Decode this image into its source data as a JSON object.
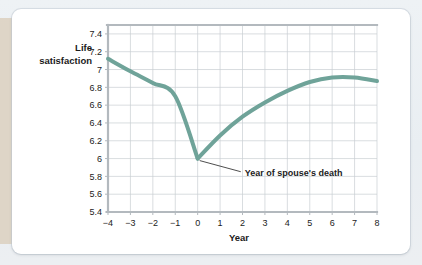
{
  "card": {
    "background_color": "#ffffff",
    "backdrop_color": "#eef1f4",
    "strip_color": "#ddd3c4"
  },
  "chart_data": {
    "type": "line",
    "title": "",
    "xlabel": "Year",
    "ylabel": "Life satisfaction",
    "ylabel_line1": "Life",
    "ylabel_line2": "satisfaction",
    "xlim": [
      -4,
      8
    ],
    "ylim": [
      5.4,
      7.5
    ],
    "grid": true,
    "legend": "none",
    "line_color": "#6fa399",
    "line_width": 4,
    "x": [
      -4,
      -3,
      -2,
      -1,
      0,
      1,
      2,
      3,
      4,
      5,
      6,
      7,
      8
    ],
    "values": [
      7.12,
      6.98,
      6.85,
      6.7,
      6.0,
      6.26,
      6.47,
      6.63,
      6.76,
      6.86,
      6.91,
      6.91,
      6.87
    ],
    "xticks": [
      "−4",
      "−3",
      "−2",
      "−1",
      "0",
      "1",
      "2",
      "3",
      "4",
      "5",
      "6",
      "7",
      "8"
    ],
    "xtick_values": [
      -4,
      -3,
      -2,
      -1,
      0,
      1,
      2,
      3,
      4,
      5,
      6,
      7,
      8
    ],
    "yticks": [
      "7.4",
      "7.2",
      "7",
      "6.8",
      "6.6",
      "6.4",
      "6.2",
      "6",
      "5.8",
      "5.6",
      "5.4"
    ],
    "ytick_values": [
      7.4,
      7.2,
      7.0,
      6.8,
      6.6,
      6.4,
      6.2,
      6.0,
      5.8,
      5.6,
      5.4
    ],
    "annotations": [
      {
        "text": "Year of spouse's death",
        "point_x": 0,
        "point_y": 6.0,
        "label_x": 2.1,
        "label_y": 5.83
      }
    ]
  }
}
